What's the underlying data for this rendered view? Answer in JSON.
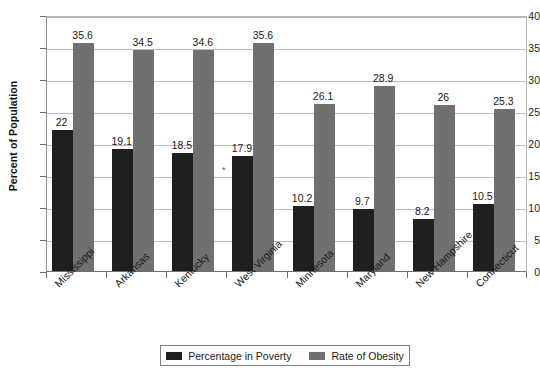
{
  "chart_data": {
    "type": "bar",
    "title": "",
    "xlabel": "",
    "ylabel": "Percent of Population",
    "ylim": [
      0,
      40
    ],
    "ytick_step": 5,
    "yticks": [
      0,
      5,
      10,
      15,
      20,
      25,
      30,
      35,
      40
    ],
    "grid": true,
    "legend_position": "bottom",
    "categories": [
      "Mississippi",
      "Arkansas",
      "Kentucky",
      "West Virginia",
      "Minnesota",
      "Maryland",
      "New Hampshire",
      "Connecticut"
    ],
    "series": [
      {
        "name": "Percentage in Poverty",
        "color": "#1f1f1f",
        "values": [
          22,
          19.1,
          18.5,
          17.9,
          10.2,
          9.7,
          8.2,
          10.5
        ],
        "labels": [
          "22",
          "19.1",
          "18.5",
          "17.9",
          "10.2",
          "9.7",
          "8.2",
          "10.5"
        ]
      },
      {
        "name": "Rate of Obesity",
        "color": "#707070",
        "values": [
          35.6,
          34.5,
          34.6,
          35.6,
          26.1,
          28.9,
          26,
          25.3
        ],
        "labels": [
          "35.6",
          "34.5",
          "34.6",
          "35.6",
          "26.1",
          "28.9",
          "26",
          "25.3"
        ]
      }
    ],
    "annotations": [
      {
        "text": "*",
        "x": 222,
        "y": 166
      }
    ]
  },
  "legend": {
    "items": [
      {
        "label": "Percentage in Poverty",
        "swatch": "poverty"
      },
      {
        "label": "Rate of Obesity",
        "swatch": "obesity"
      }
    ]
  }
}
